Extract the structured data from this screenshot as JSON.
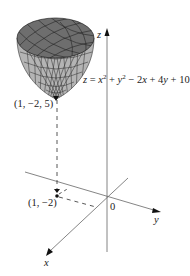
{
  "figure": {
    "surface_equation": {
      "lhs": "z",
      "eq": " = ",
      "x": "x",
      "x_exp": "2",
      "plus1": " + ",
      "y": "y",
      "y_exp": "2",
      "rest": " − 2",
      "x2": "x",
      "plus2": " + 4",
      "y2": "y",
      "plus3": " + 10"
    },
    "vertex_label": "(1, −2, 5)",
    "projection_label": "(1, −2)",
    "origin_label": "0",
    "axis_labels": {
      "x": "x",
      "y": "y",
      "z": "z"
    },
    "colors": {
      "surface_dark": "#6e6e6e",
      "surface_light": "#b4b4b4",
      "mesh": "#1e1e1e",
      "axis": "#555555",
      "text": "#222222"
    }
  }
}
